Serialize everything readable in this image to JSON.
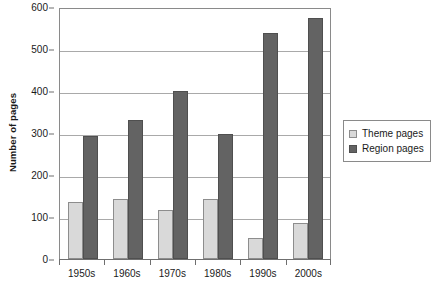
{
  "chart_data": {
    "type": "bar",
    "title": "",
    "xlabel": "",
    "ylabel": "Number of pages",
    "categories": [
      "1950s",
      "1960s",
      "1970s",
      "1980s",
      "1990s",
      "2000s"
    ],
    "series": [
      {
        "name": "Theme pages",
        "color": "#d9d9d9",
        "values": [
          135,
          143,
          117,
          142,
          50,
          85
        ]
      },
      {
        "name": "Region pages",
        "color": "#636363",
        "values": [
          293,
          330,
          400,
          297,
          537,
          575
        ]
      }
    ],
    "ylim": [
      0,
      600
    ],
    "yticks": [
      0,
      100,
      200,
      300,
      400,
      500,
      600
    ],
    "ytick_labels": [
      "0",
      "100",
      "200",
      "300",
      "400",
      "500",
      "600"
    ],
    "grid": true,
    "legend_position": "right"
  },
  "legend": {
    "entries": [
      {
        "label": "Theme pages"
      },
      {
        "label": "Region pages"
      }
    ]
  }
}
